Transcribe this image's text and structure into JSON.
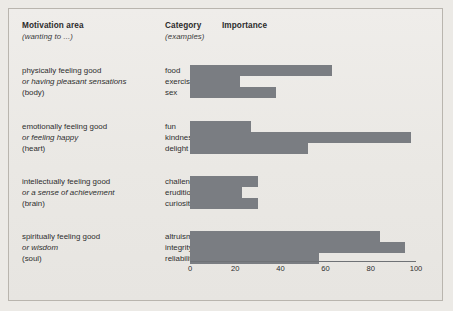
{
  "figure": {
    "background_color": "#eae8e4",
    "bar_color": "#7a7d82",
    "border_color": "#b9b5ae"
  },
  "headers": {
    "motivation_title": "Motivation area",
    "motivation_subtitle": "(wanting to ...)",
    "category_title": "Category",
    "category_subtitle": "(examples)",
    "importance_title": "Importance"
  },
  "rows": [
    {
      "motivation_line1": "physically feeling good",
      "motivation_line2": "or having pleasant sensations",
      "motivation_line3": "(body)",
      "categories": [
        "food",
        "exercise",
        "sex"
      ],
      "values": [
        63,
        22,
        38
      ]
    },
    {
      "motivation_line1": "emotionally feeling good",
      "motivation_line2": "or feeling happy",
      "motivation_line3": "(heart)",
      "categories": [
        "fun",
        "kindness",
        "delight"
      ],
      "values": [
        27,
        98,
        52
      ]
    },
    {
      "motivation_line1": "intellectually feeling good",
      "motivation_line2": "or a sense of achievement",
      "motivation_line3": "(brain)",
      "categories": [
        "challenges",
        "erudition",
        "curiosity"
      ],
      "values": [
        30,
        23,
        30
      ]
    },
    {
      "motivation_line1": "spiritually feeling good",
      "motivation_line2": "or wisdom",
      "motivation_line3": "(soul)",
      "categories": [
        "altruism",
        "integrity",
        "reliability"
      ],
      "values": [
        84,
        95,
        57
      ]
    }
  ],
  "axis": {
    "ticks": [
      "0",
      "20",
      "40",
      "60",
      "80",
      "100"
    ],
    "min": 0,
    "max": 100
  },
  "chart_data": {
    "type": "bar",
    "title": "Importance",
    "xlabel": "Importance",
    "ylabel": "",
    "xlim": [
      0,
      100
    ],
    "grid": false,
    "legend": "none",
    "orientation": "horizontal",
    "categories": [
      "food",
      "exercise",
      "sex",
      "fun",
      "kindness",
      "delight",
      "challenges",
      "erudition",
      "curiosity",
      "altruism",
      "integrity",
      "reliability"
    ],
    "values": [
      63,
      22,
      38,
      27,
      98,
      52,
      30,
      23,
      30,
      84,
      95,
      57
    ],
    "groups": [
      {
        "name": "physically feeling good / or having pleasant sensations / (body)",
        "categories": [
          "food",
          "exercise",
          "sex"
        ],
        "values": [
          63,
          22,
          38
        ]
      },
      {
        "name": "emotionally feeling good / or feeling happy / (heart)",
        "categories": [
          "fun",
          "kindness",
          "delight"
        ],
        "values": [
          27,
          98,
          52
        ]
      },
      {
        "name": "intellectually feeling good / or a sense of achievement / (brain)",
        "categories": [
          "challenges",
          "erudition",
          "curiosity"
        ],
        "values": [
          30,
          23,
          30
        ]
      },
      {
        "name": "spiritually feeling good / or wisdom / (soul)",
        "categories": [
          "altruism",
          "integrity",
          "reliability"
        ],
        "values": [
          84,
          95,
          57
        ]
      }
    ],
    "tick_labels": [
      "0",
      "20",
      "40",
      "60",
      "80",
      "100"
    ]
  }
}
